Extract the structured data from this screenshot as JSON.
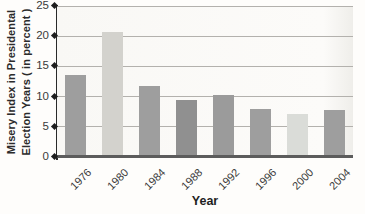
{
  "chart_data": {
    "type": "bar",
    "title": "",
    "ylabel_line1": "Misery Index in Presidental",
    "ylabel_line2": "Election Years ( in percent )",
    "xlabel": "Year",
    "categories": [
      "1976",
      "1980",
      "1984",
      "1988",
      "1992",
      "1996",
      "2000",
      "2004"
    ],
    "values": [
      13.5,
      20.7,
      11.7,
      9.5,
      10.3,
      7.9,
      7.2,
      7.8
    ],
    "ylim": [
      0,
      25
    ],
    "yticks": [
      0,
      5,
      10,
      15,
      20,
      25
    ],
    "grid": "horizontal",
    "legend": "none",
    "bar_colors": [
      "#9e9e9e",
      "#d3d2cd",
      "#9e9e9e",
      "#909090",
      "#9b9b9b",
      "#9e9e9e",
      "#dadcd8",
      "#9e9e9e"
    ],
    "axis_color": "#2a2a2a",
    "gridline_color": "#b3b1ad",
    "baseline_color": "#5c5c5c"
  }
}
